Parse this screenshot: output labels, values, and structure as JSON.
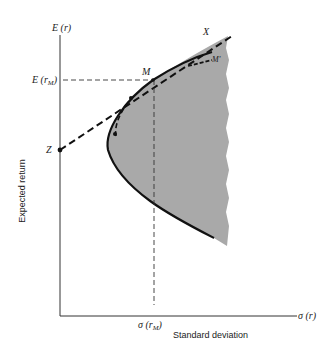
{
  "diagram": {
    "title": "",
    "y_axis": {
      "symbol": "E (r)",
      "label": "Expected return",
      "tick_labels": {
        "market_return": "E (r",
        "market_return_sub": "M",
        "market_return_close": ")",
        "risk_free": "Z"
      }
    },
    "x_axis": {
      "symbol": "σ (r)",
      "label": "Standard deviation",
      "tick_labels": {
        "market_sd": "σ (r",
        "market_sd_sub": "M",
        "market_sd_close": ")"
      }
    },
    "points": {
      "market": "M",
      "alternative": "M'",
      "line_end": "X",
      "intercept": "Z"
    },
    "colors": {
      "shaded_region": "#a9a9a9",
      "lines": "#111111",
      "dashed_guides": "#333333"
    }
  }
}
